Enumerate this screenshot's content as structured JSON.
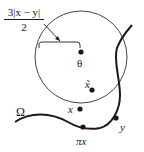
{
  "diagram": {
    "radius_label": {
      "numerator": "3|x − y|",
      "denominator": "2"
    },
    "points": {
      "theta": "θ",
      "x_tilde": "x̃",
      "x": "x",
      "pi_x": "πx",
      "y": "y"
    },
    "domain_label": "Ω",
    "colors": {
      "stroke": "#1a1a1a",
      "circle": "#444444",
      "background": "#ffffff"
    }
  }
}
